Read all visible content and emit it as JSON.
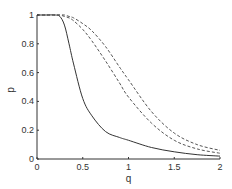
{
  "chart_data": {
    "type": "line",
    "title": "",
    "xlabel": "q",
    "ylabel": "p",
    "xlim": [
      0,
      2
    ],
    "ylim": [
      0,
      1
    ],
    "grid": false,
    "legend": null,
    "xticks": [
      "0",
      "0.5",
      "1",
      "1.5",
      "2"
    ],
    "yticks": [
      "0",
      "0.2",
      "0.4",
      "0.6",
      "0.8",
      "1"
    ],
    "x": [
      0,
      0.1,
      0.2,
      0.25,
      0.3,
      0.35,
      0.4,
      0.5,
      0.6,
      0.75,
      0.9,
      1.0,
      1.25,
      1.5,
      1.75,
      2.0
    ],
    "series": [
      {
        "name": "solid",
        "style": "solid",
        "values": [
          1.0,
          1.0,
          1.0,
          0.99,
          0.93,
          0.8,
          0.66,
          0.42,
          0.3,
          0.19,
          0.15,
          0.13,
          0.08,
          0.05,
          0.03,
          0.02
        ]
      },
      {
        "name": "dashed-1",
        "style": "dashed",
        "values": [
          1.0,
          1.0,
          1.0,
          1.0,
          0.99,
          0.98,
          0.96,
          0.9,
          0.82,
          0.68,
          0.53,
          0.43,
          0.25,
          0.13,
          0.07,
          0.04
        ]
      },
      {
        "name": "dashed-2",
        "style": "dashed",
        "values": [
          1.0,
          1.0,
          1.0,
          1.0,
          1.0,
          0.99,
          0.98,
          0.94,
          0.89,
          0.78,
          0.64,
          0.55,
          0.33,
          0.18,
          0.1,
          0.06
        ]
      }
    ]
  },
  "colors": {
    "axis": "#333333",
    "solid_line": "#333333",
    "dashed_line": "#555555"
  }
}
